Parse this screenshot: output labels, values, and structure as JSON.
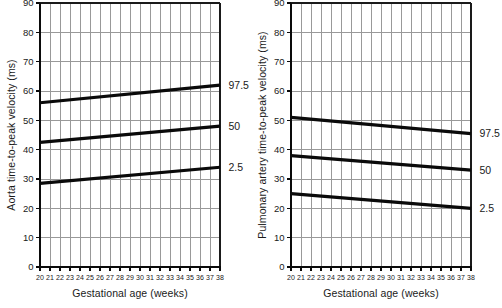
{
  "chart_data": [
    {
      "id": "aorta",
      "type": "line",
      "title": "",
      "xlabel": "Gestational age (weeks)",
      "ylabel": "Aorta time-to-peak velocity (ms)",
      "xlim": [
        20,
        38
      ],
      "ylim": [
        0,
        90
      ],
      "x_ticks": [
        20,
        21,
        22,
        23,
        24,
        25,
        26,
        27,
        28,
        29,
        30,
        31,
        32,
        33,
        34,
        35,
        36,
        37,
        38
      ],
      "y_ticks": [
        0,
        10,
        20,
        30,
        40,
        50,
        60,
        70,
        80,
        90
      ],
      "grid": "on",
      "legend_position": "labels-right-of-line-ends",
      "line_color": "#0a0a0a",
      "grid_color": "#999999",
      "series": [
        {
          "name": "97.5",
          "x": [
            20,
            38
          ],
          "values": [
            56,
            62
          ]
        },
        {
          "name": "50",
          "x": [
            20,
            38
          ],
          "values": [
            42.5,
            48
          ]
        },
        {
          "name": "2.5",
          "x": [
            20,
            38
          ],
          "values": [
            28.5,
            34
          ]
        }
      ]
    },
    {
      "id": "pulmonary-artery",
      "type": "line",
      "title": "",
      "xlabel": "Gestational age (weeks)",
      "ylabel": "Pulmonary artery time-to-peak velocity (ms)",
      "xlim": [
        20,
        38
      ],
      "ylim": [
        0,
        90
      ],
      "x_ticks": [
        20,
        21,
        22,
        23,
        24,
        25,
        26,
        27,
        28,
        29,
        30,
        31,
        32,
        33,
        34,
        35,
        36,
        37,
        38
      ],
      "y_ticks": [
        0,
        10,
        20,
        30,
        40,
        50,
        60,
        70,
        80,
        90
      ],
      "grid": "on",
      "legend_position": "labels-right-of-line-ends",
      "line_color": "#0a0a0a",
      "grid_color": "#999999",
      "series": [
        {
          "name": "97.5",
          "x": [
            20,
            38
          ],
          "values": [
            51,
            45.5
          ]
        },
        {
          "name": "50",
          "x": [
            20,
            38
          ],
          "values": [
            38,
            33
          ]
        },
        {
          "name": "2.5",
          "x": [
            20,
            38
          ],
          "values": [
            25,
            20
          ]
        }
      ]
    }
  ]
}
